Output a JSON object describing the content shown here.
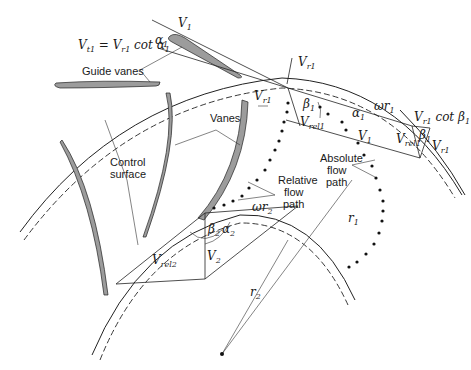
{
  "diagram": {
    "labels": {
      "guide_vanes": "Guide vanes",
      "vanes": "Vanes",
      "control_surface_1": "Control",
      "control_surface_2": "surface",
      "relative_flow_1": "Relative",
      "relative_flow_2": "flow",
      "relative_flow_3": "path",
      "absolute_flow_1": "Absolute",
      "absolute_flow_2": "flow",
      "absolute_flow_3": "path"
    },
    "math": {
      "vt1_eq": "V",
      "vt1_sub": "t1",
      "eq_mid": " = V",
      "eq_sub": "r1",
      "cot_alpha": " cot α",
      "cot_alpha_sub": "1",
      "v1_top": "V",
      "v1_top_sub": "1",
      "alpha1_top": "α",
      "alpha1_top_sub": "1",
      "vr1_top": "V",
      "vr1_top_sub": "r1",
      "vr1_left": "V",
      "vr1_left_sub": "r1",
      "beta1": "β",
      "beta1_sub": "1",
      "vrel1": "V",
      "vrel1_sub": "rel1",
      "alpha1_mid": "α",
      "alpha1_mid_sub": "1",
      "omega_r1": "ωr",
      "omega_r1_sub": "1",
      "v1_mid": "V",
      "v1_mid_sub": "1",
      "vr1_cot": "V",
      "vr1_cot_sub": "r1",
      "cot_beta": " cot β",
      "cot_beta_sub": "1",
      "vrel1_right": "V",
      "vrel1_right_sub": "rel1",
      "beta1_right": "β",
      "beta1_right_sub": "1",
      "vr1_right": "V",
      "vr1_right_sub": "r1",
      "omega_r2": "ωr",
      "omega_r2_sub": "2",
      "beta2": "β",
      "beta2_sub": "2",
      "alpha2": "α",
      "alpha2_sub": "2",
      "vrel2": "V",
      "vrel2_sub": "rel2",
      "v2": "V",
      "v2_sub": "2",
      "r1": "r",
      "r1_sub": "1",
      "r2": "r",
      "r2_sub": "2"
    }
  }
}
